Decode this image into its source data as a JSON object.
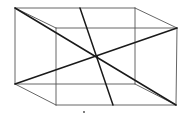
{
  "diagram": {
    "type": "cuboid-wireframe-with-diagonals",
    "background": "#ffffff",
    "thin_stroke": "#555555",
    "thick_stroke": "#1a1a1a",
    "vertices": {
      "back_top_left": [
        15,
        8
      ],
      "back_top_right": [
        135,
        8
      ],
      "back_bottom_left": [
        15,
        84
      ],
      "back_bottom_right": [
        135,
        84
      ],
      "front_top_left": [
        56,
        28
      ],
      "front_top_right": [
        177,
        28
      ],
      "front_bottom_left": [
        56,
        105
      ],
      "front_bottom_right": [
        176,
        105
      ]
    },
    "edges": [
      [
        "back_top_left",
        "back_top_right"
      ],
      [
        "back_top_right",
        "back_bottom_right"
      ],
      [
        "back_bottom_right",
        "back_bottom_left"
      ],
      [
        "back_bottom_left",
        "back_top_left"
      ],
      [
        "front_top_left",
        "front_top_right"
      ],
      [
        "front_top_right",
        "front_bottom_right"
      ],
      [
        "front_bottom_right",
        "front_bottom_left"
      ],
      [
        "front_bottom_left",
        "front_top_left"
      ],
      [
        "back_top_left",
        "front_top_left"
      ],
      [
        "back_top_right",
        "front_top_right"
      ],
      [
        "back_bottom_left",
        "front_bottom_left"
      ],
      [
        "back_bottom_right",
        "front_bottom_right"
      ]
    ],
    "diagonals": [
      {
        "name": "diagonal-top-left-to-bottom-right",
        "from": [
          15,
          8
        ],
        "to": [
          176,
          105
        ]
      },
      {
        "name": "diagonal-bottom-left-to-top-right",
        "from": [
          15,
          84
        ],
        "to": [
          177,
          28
        ]
      },
      {
        "name": "steep-line-top-to-bottom",
        "from": [
          80,
          8
        ],
        "to": [
          113,
          105
        ]
      }
    ],
    "intersection": [
      97,
      57
    ],
    "marks": [
      {
        "name": "small-dot-mark",
        "at": [
          84,
          112
        ]
      }
    ]
  }
}
